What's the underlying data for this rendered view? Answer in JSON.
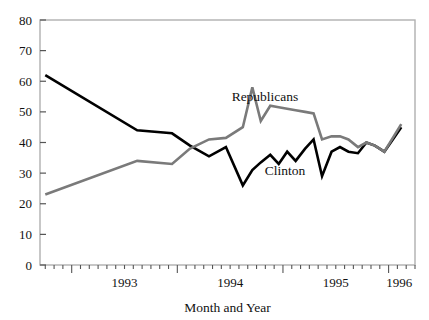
{
  "chart_data": {
    "type": "line",
    "title": "",
    "xlabel": "Month and Year",
    "ylabel": "",
    "ylim": [
      0,
      80
    ],
    "yticks": [
      0,
      10,
      20,
      30,
      40,
      50,
      60,
      70,
      80
    ],
    "ytick_labels": [
      "0",
      "10",
      "20",
      "30",
      "40",
      "50",
      "60",
      "70",
      "80"
    ],
    "xlim": [
      1992.7,
      1996.25
    ],
    "xticks": [
      1993,
      1994,
      1995,
      1996
    ],
    "xtick_labels": [
      "1993",
      "1994",
      "1995",
      "1996"
    ],
    "x_minor_interval_months": 1,
    "grid": false,
    "legend_position": "inline-annotations",
    "frame": "full-box",
    "series": [
      {
        "name": "Clinton",
        "color": "#000000",
        "line_width": 2.6,
        "label_x": 1995.02,
        "label_y": 29.5,
        "x": [
          1992.75,
          1993.62,
          1993.95,
          1994.12,
          1994.3,
          1994.46,
          1994.62,
          1994.71,
          1994.79,
          1994.88,
          1994.96,
          1995.04,
          1995.12,
          1995.21,
          1995.29,
          1995.37,
          1995.46,
          1995.54,
          1995.62,
          1995.71,
          1995.79,
          1995.87,
          1995.96,
          1996.04,
          1996.12
        ],
        "y": [
          62,
          44,
          43,
          39,
          35.5,
          38.5,
          26,
          31,
          33.5,
          36,
          33,
          37,
          34,
          38,
          41,
          29,
          37,
          38.5,
          37,
          36.5,
          40,
          39,
          37,
          41,
          45
        ]
      },
      {
        "name": "Republicans",
        "color": "#7a7a7a",
        "line_width": 2.6,
        "label_x": 1994.83,
        "label_y": 53.5,
        "x": [
          1992.75,
          1993.62,
          1993.95,
          1994.12,
          1994.3,
          1994.46,
          1994.62,
          1994.71,
          1994.79,
          1994.88,
          1994.96,
          1995.04,
          1995.12,
          1995.21,
          1995.29,
          1995.37,
          1995.46,
          1995.54,
          1995.62,
          1995.71,
          1995.79,
          1995.87,
          1995.96,
          1996.04,
          1996.12
        ],
        "y": [
          23,
          34,
          33,
          38,
          41,
          41.5,
          45,
          58,
          47,
          52,
          51.5,
          51,
          50.5,
          50,
          49.5,
          41,
          42,
          42,
          41,
          38.5,
          40,
          39,
          37,
          41.5,
          46
        ]
      }
    ]
  },
  "axis_colors": {
    "frame": "#b0b0b0",
    "tick": "#555555",
    "text": "#111111"
  }
}
